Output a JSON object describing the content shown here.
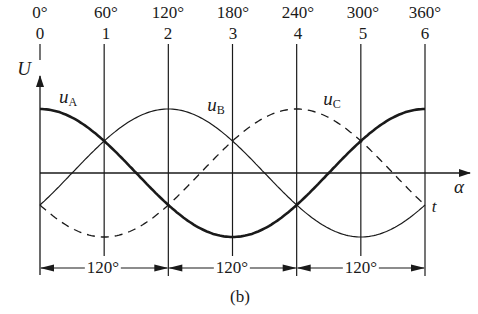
{
  "figure": {
    "caption": "(b)",
    "y_axis_label": "U",
    "x_axis_label": "α",
    "time_label": "t",
    "degree_ticks": [
      "0°",
      "60°",
      "120°",
      "180°",
      "240°",
      "300°",
      "360°"
    ],
    "index_ticks": [
      "0",
      "1",
      "2",
      "3",
      "4",
      "5",
      "6"
    ],
    "dimension_labels": [
      "120°",
      "120°",
      "120°"
    ],
    "curves": [
      {
        "name": "uA",
        "label_main": "u",
        "label_sub": "A",
        "style": "thick-solid",
        "phase_peak_deg": 0
      },
      {
        "name": "uB",
        "label_main": "u",
        "label_sub": "B",
        "style": "thin-solid",
        "phase_peak_deg": 120
      },
      {
        "name": "uC",
        "label_main": "u",
        "label_sub": "C",
        "style": "dashed",
        "phase_peak_deg": 240
      }
    ]
  },
  "chart_data": {
    "type": "line",
    "title": "",
    "xlabel": "α",
    "ylabel": "U",
    "x_ticks_deg": [
      0,
      60,
      120,
      180,
      240,
      300,
      360
    ],
    "x_tick_indices": [
      0,
      1,
      2,
      3,
      4,
      5,
      6
    ],
    "series": [
      {
        "name": "uA",
        "function": "cos(α)",
        "peak_at_deg": 0
      },
      {
        "name": "uB",
        "function": "cos(α-120°)",
        "peak_at_deg": 120
      },
      {
        "name": "uC",
        "function": "cos(α-240°)",
        "peak_at_deg": 240
      }
    ],
    "annotations": [
      "120° spacing between 0–2, 2–4, 4–6"
    ]
  },
  "colors": {
    "ink": "#1a1a1a",
    "background": "#ffffff"
  }
}
